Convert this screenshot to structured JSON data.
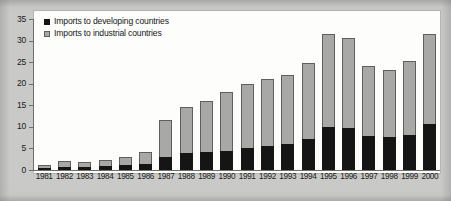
{
  "chart_data": {
    "type": "bar",
    "stacked": true,
    "title": "",
    "subtitle": "",
    "xlabel": "",
    "ylabel": "",
    "ylim": [
      0,
      35
    ],
    "yticks": [
      "0",
      "5",
      "10",
      "15",
      "20",
      "25",
      "30",
      "35"
    ],
    "grid": false,
    "legend_position": "top-left",
    "categories": [
      "1981",
      "1982",
      "1983",
      "1984",
      "1985",
      "1986",
      "1987",
      "1988",
      "1989",
      "1990",
      "1991",
      "1992",
      "1993",
      "1994",
      "1995",
      "1996",
      "1997",
      "1998",
      "1999",
      "2000"
    ],
    "series": [
      {
        "name": "Imports to developing countries",
        "color": "#151515",
        "values": [
          0.5,
          0.8,
          0.8,
          1.0,
          1.2,
          1.4,
          3.0,
          3.9,
          4.2,
          4.4,
          5.0,
          5.6,
          6.0,
          7.2,
          9.9,
          9.7,
          7.9,
          7.6,
          8.0,
          10.7
        ]
      },
      {
        "name": "Imports to industrial countries",
        "color": "#a8a8a6",
        "values": [
          0.7,
          1.2,
          1.1,
          1.4,
          1.8,
          2.8,
          8.6,
          10.6,
          11.8,
          13.6,
          15.0,
          15.4,
          16.0,
          17.6,
          21.6,
          20.8,
          16.3,
          15.5,
          17.2,
          20.9
        ]
      }
    ],
    "totals": [
      1.2,
      2.0,
      1.9,
      2.4,
      3.0,
      4.2,
      11.6,
      14.5,
      16.0,
      18.0,
      20.0,
      21.0,
      22.0,
      24.8,
      31.5,
      30.5,
      24.2,
      23.1,
      25.2,
      31.6
    ]
  },
  "legend": {
    "items": [
      {
        "label": "Imports to developing countries"
      },
      {
        "label": "Imports to industrial countries"
      }
    ]
  }
}
